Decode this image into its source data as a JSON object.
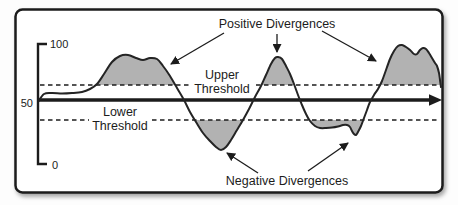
{
  "figure": {
    "y_axis_ticks": [
      "100",
      "50",
      "0"
    ],
    "annotations": {
      "positive": "Positive Divergences",
      "negative": "Negative Divergences"
    },
    "thresholds": {
      "upper": [
        "Upper",
        "Threshold"
      ],
      "lower": [
        "Lower",
        "Threshold"
      ]
    },
    "colors": {
      "shade": "#b2b2b2",
      "ink": "#1c1c1c",
      "paper": "#ffffff"
    }
  },
  "chart_data": {
    "type": "line",
    "title": "",
    "xlabel": "",
    "ylabel": "",
    "y_ticks": [
      0,
      50,
      100
    ],
    "ylim": [
      0,
      100
    ],
    "grid": false,
    "threshold_labels": [
      "Upper Threshold",
      "Lower Threshold"
    ],
    "annotation_labels": [
      "Positive Divergences",
      "Negative Divergences"
    ],
    "series": [
      {
        "name": "oscillator",
        "x_percent": [
          0,
          6,
          11,
          16,
          21,
          25,
          30,
          34,
          39,
          43,
          45,
          50,
          55,
          60,
          65,
          69,
          74,
          78,
          82,
          86,
          90,
          94,
          96,
          98,
          100
        ],
        "y": [
          52,
          59,
          60,
          75,
          90,
          88,
          88,
          65,
          38,
          18,
          12,
          39,
          64,
          89,
          58,
          30,
          31,
          25,
          52,
          78,
          99,
          92,
          96,
          88,
          64
        ]
      }
    ],
    "shaded_regions": "areas where curve exceeds upper threshold or falls below lower threshold"
  }
}
